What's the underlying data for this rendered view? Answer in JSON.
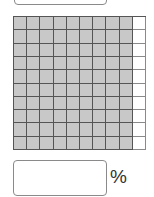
{
  "top_answer_box": {
    "value": ""
  },
  "grid": {
    "rows": 10,
    "columns": 10,
    "shaded_columns": 9,
    "shaded_cells": 90,
    "total_cells": 100,
    "shaded_color": "#c8c8c8",
    "empty_color": "#ffffff"
  },
  "bottom_answer_box": {
    "value": "",
    "unit": "%"
  }
}
